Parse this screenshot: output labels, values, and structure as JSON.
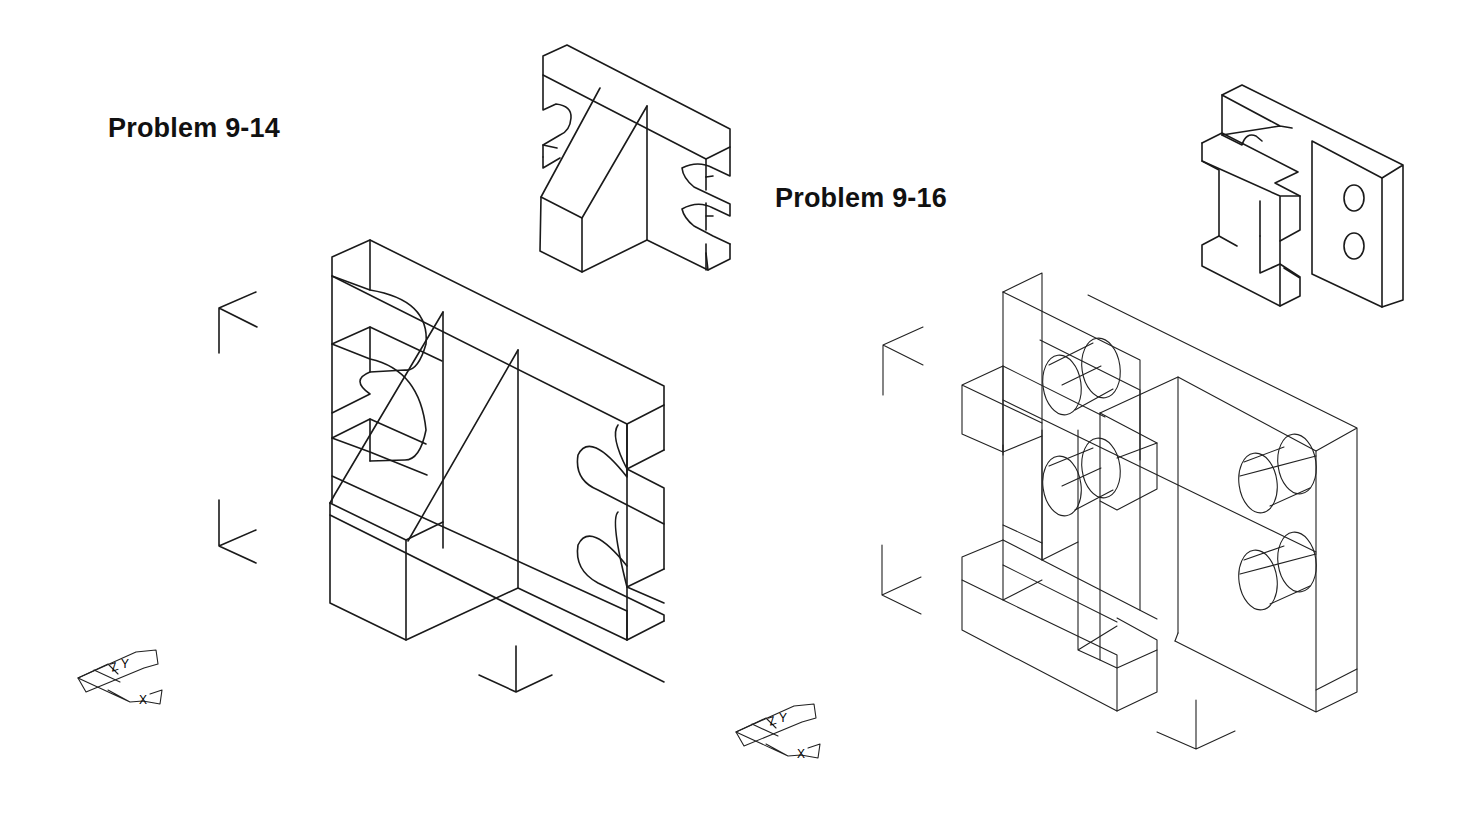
{
  "problems": [
    {
      "id": "p914",
      "title": "Problem 9-14"
    },
    {
      "id": "p916",
      "title": "Problem 9-16"
    }
  ],
  "axis_labels": {
    "y": "Y",
    "z": "Z",
    "x": "X"
  }
}
